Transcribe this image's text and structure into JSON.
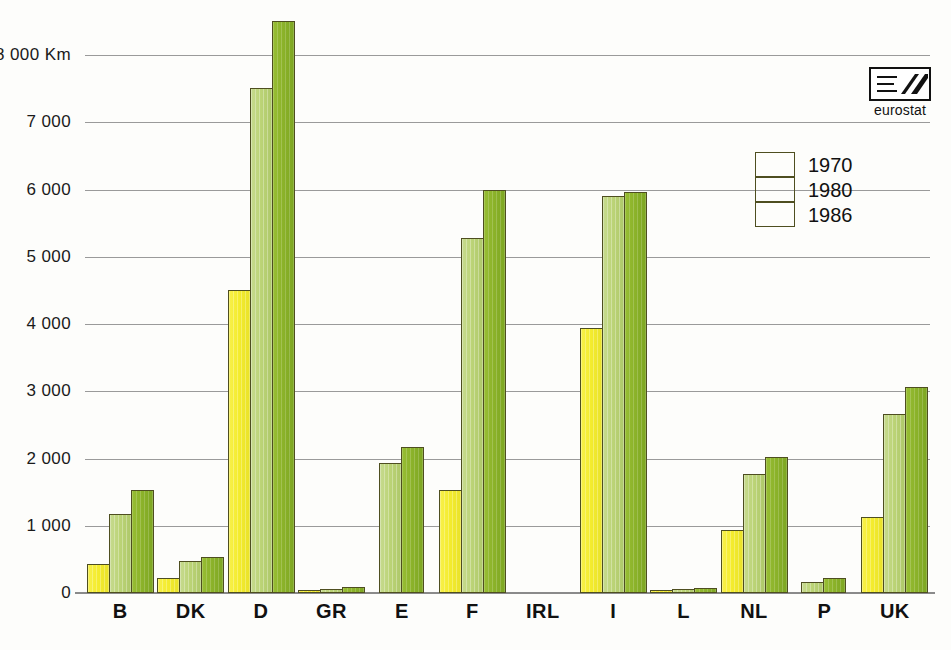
{
  "chart_data": {
    "type": "bar",
    "title": "",
    "subtitle": "",
    "xlabel": "",
    "ylabel": "",
    "unit_label": "Km",
    "categories": [
      "B",
      "DK",
      "D",
      "GR",
      "E",
      "F",
      "IRL",
      "I",
      "L",
      "NL",
      "P",
      "UK"
    ],
    "series": [
      {
        "name": "1970",
        "color": "#f4ec2e",
        "values": [
          430,
          220,
          4500,
          10,
          0,
          1530,
          0,
          3940,
          20,
          940,
          0,
          1130
        ]
      },
      {
        "name": "1980",
        "color": "#bcd477",
        "values": [
          1180,
          475,
          7510,
          55,
          1930,
          5280,
          0,
          5900,
          60,
          1770,
          165,
          2660
        ]
      },
      {
        "name": "1986",
        "color": "#8cb32a",
        "values": [
          1530,
          535,
          8500,
          90,
          2170,
          5990,
          0,
          5960,
          80,
          2020,
          220,
          3060
        ]
      }
    ],
    "ylim": [
      0,
      8000
    ],
    "yticks": [
      0,
      1000,
      2000,
      3000,
      4000,
      5000,
      6000,
      7000,
      8000
    ],
    "ytick_labels": [
      "0",
      "1 000",
      "2 000",
      "3 000",
      "4 000",
      "5 000",
      "6 000",
      "7 000",
      "8 000 Km"
    ],
    "grid": true,
    "legend_position": "top-right",
    "legend": [
      "1970",
      "1980",
      "1986"
    ]
  },
  "logo": {
    "wordmark": "eurostat",
    "symbol": "eurostat-logo"
  }
}
